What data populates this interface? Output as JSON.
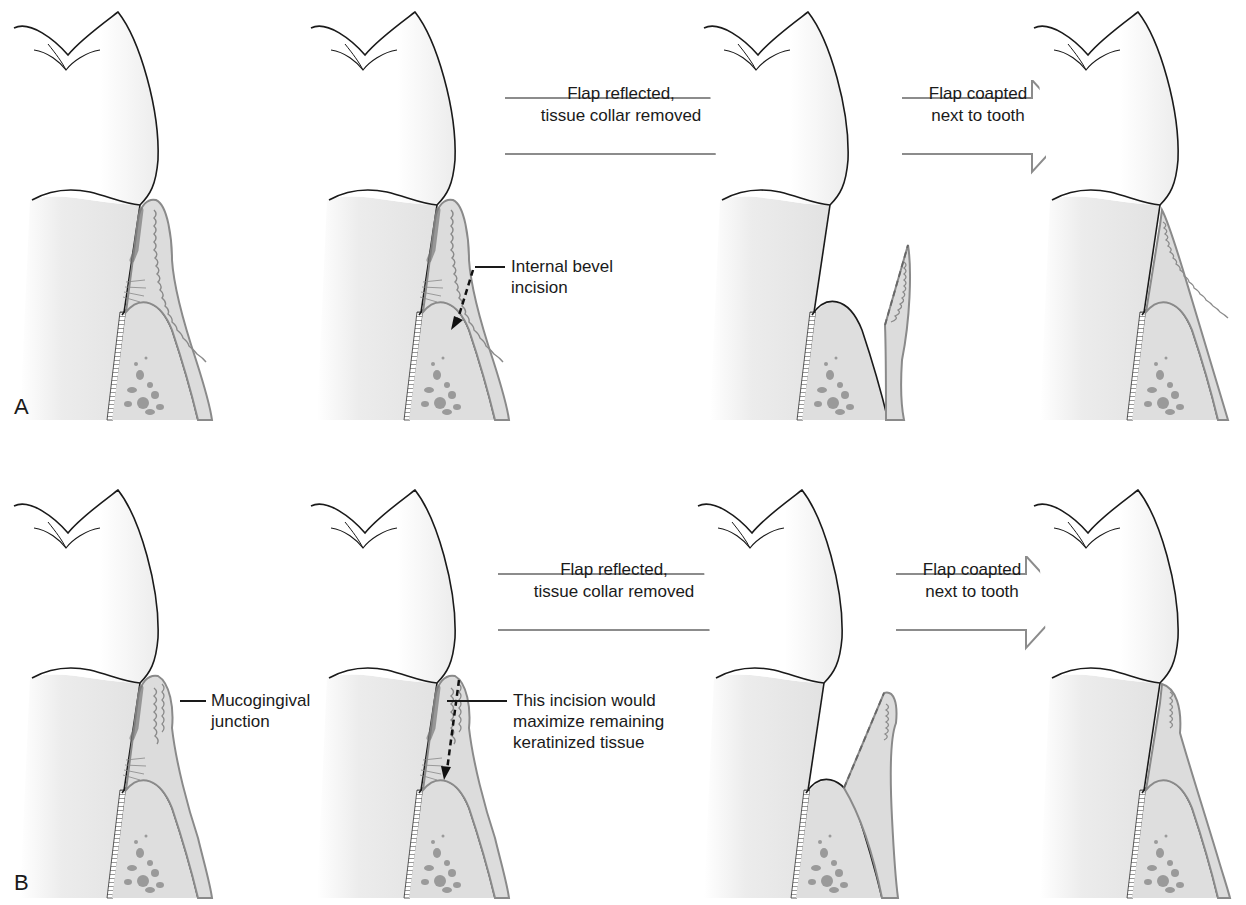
{
  "figure": {
    "rows": [
      {
        "id": "A",
        "label": "A",
        "arrows": [
          {
            "line1": "Flap reflected,",
            "line2": "tissue collar removed"
          },
          {
            "line1": "Flap coapted",
            "line2": "next to tooth"
          }
        ],
        "callout": {
          "line1": "Internal bevel",
          "line2": "incision"
        }
      },
      {
        "id": "B",
        "label": "B",
        "arrows": [
          {
            "line1": "Flap reflected,",
            "line2": "tissue collar removed"
          },
          {
            "line1": "Flap coapted",
            "line2": "next to tooth"
          }
        ],
        "callout_left": {
          "line1": "Mucogingival",
          "line2": "junction"
        },
        "callout": {
          "line1": "This incision would",
          "line2": "maximize remaining",
          "line3": "keratinized tissue"
        }
      }
    ],
    "colors": {
      "outline": "#1a1a1a",
      "tissue_fill": "#dcdcdc",
      "tissue_edge": "#8a8a8a",
      "root_fill": "#ededed",
      "arrow_stroke": "#8c8c8c"
    }
  }
}
